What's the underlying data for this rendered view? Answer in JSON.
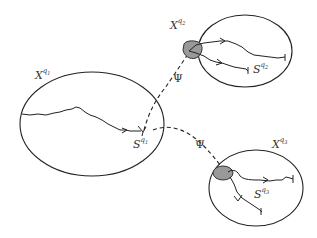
{
  "diagram": {
    "colors": {
      "stroke": "#222222",
      "shaded_region": "#999999",
      "background": "#ffffff"
    },
    "regions": [
      {
        "id": "q1",
        "label_base": "X",
        "label_sup": "q",
        "label_sub": "1",
        "set_base": "S",
        "set_sup": "q",
        "set_sub": "1"
      },
      {
        "id": "q2",
        "label_base": "X",
        "label_sup": "q",
        "label_sub": "2",
        "set_base": "S",
        "set_sup": "q",
        "set_sub": "2"
      },
      {
        "id": "q3",
        "label_base": "X",
        "label_sup": "q",
        "label_sub": "3",
        "set_base": "S",
        "set_sup": "q",
        "set_sub": "3"
      }
    ],
    "transitions": [
      {
        "from": "q1",
        "to": "q2",
        "label": "Ψ"
      },
      {
        "from": "q1",
        "to": "q3",
        "label": "Ψ"
      }
    ]
  }
}
